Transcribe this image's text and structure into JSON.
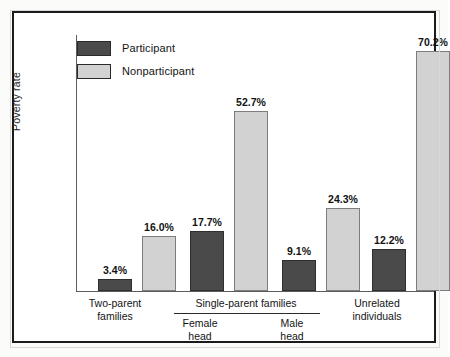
{
  "chart_data": {
    "type": "bar",
    "title": "",
    "xlabel": "",
    "ylabel": "Poverty rate",
    "grid": false,
    "legend_position": "top-left",
    "ylim": [
      0,
      75
    ],
    "categories": [
      "Two-parent families",
      "Female head",
      "Male head",
      "Unrelated individuals"
    ],
    "group_labels": {
      "single_parent": "Single-parent families"
    },
    "series": [
      {
        "name": "Participant",
        "values": [
          3.4,
          17.7,
          9.1,
          12.2
        ],
        "color": "#4a4a4a"
      },
      {
        "name": "Nonparticipant",
        "values": [
          16.0,
          52.7,
          24.3,
          70.2
        ],
        "color": "#d2d2d2"
      }
    ],
    "value_labels": [
      "3.4%",
      "16.0%",
      "17.7%",
      "52.7%",
      "9.1%",
      "24.3%",
      "12.2%",
      "70.2%"
    ]
  },
  "legend": {
    "items": [
      {
        "label": "Participant",
        "color": "#4a4a4a"
      },
      {
        "label": "Nonparticipant",
        "color": "#d2d2d2"
      }
    ]
  },
  "axis": {
    "y_title": "Poverty rate"
  },
  "bars": [
    {
      "value_label": "3.4%",
      "series": "Participant"
    },
    {
      "value_label": "16.0%",
      "series": "Nonparticipant"
    },
    {
      "value_label": "17.7%",
      "series": "Participant"
    },
    {
      "value_label": "52.7%",
      "series": "Nonparticipant"
    },
    {
      "value_label": "9.1%",
      "series": "Participant"
    },
    {
      "value_label": "24.3%",
      "series": "Nonparticipant"
    },
    {
      "value_label": "12.2%",
      "series": "Participant"
    },
    {
      "value_label": "70.2%",
      "series": "Nonparticipant"
    }
  ],
  "xlabels": {
    "two_parent_line1": "Two-parent",
    "two_parent_line2": "families",
    "single_parent": "Single-parent families",
    "female_line1": "Female",
    "female_line2": "head",
    "male_line1": "Male",
    "male_line2": "head",
    "unrelated_line1": "Unrelated",
    "unrelated_line2": "individuals"
  }
}
